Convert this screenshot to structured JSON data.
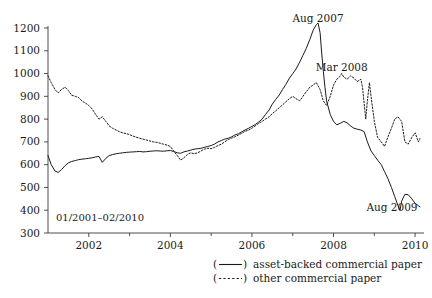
{
  "chart_data": {
    "type": "line",
    "title": "",
    "xlabel": "",
    "ylabel": "",
    "range_note": "01/2001–02/2010",
    "xlim": [
      2001.0,
      2010.12
    ],
    "ylim": [
      300,
      1200
    ],
    "yticks": [
      300,
      400,
      500,
      600,
      700,
      800,
      900,
      1000,
      1100,
      1200
    ],
    "xticks_major": [
      2002,
      2004,
      2006,
      2008,
      2010
    ],
    "xticks_minor": [
      2003,
      2005,
      2007,
      2009
    ],
    "xtick_labels": [
      "2002",
      "2004",
      "2006",
      "2008",
      "2010"
    ],
    "grid": false,
    "legend_position": "below-right",
    "annotations": [
      {
        "text": "Aug 2007",
        "x": 2007.62,
        "y": 1225
      },
      {
        "text": "Mar 2008",
        "x": 2008.2,
        "y": 1010
      },
      {
        "text": "Aug 2009",
        "x": 2009.63,
        "y": 395
      }
    ],
    "series": [
      {
        "name": "asset-backed commercial paper",
        "style": "solid",
        "x": [
          2001.0,
          2001.08,
          2001.17,
          2001.25,
          2001.33,
          2001.42,
          2001.5,
          2001.58,
          2001.67,
          2001.75,
          2001.83,
          2001.92,
          2002.0,
          2002.08,
          2002.17,
          2002.25,
          2002.33,
          2002.42,
          2002.5,
          2002.58,
          2002.67,
          2002.75,
          2002.83,
          2002.92,
          2003.0,
          2003.08,
          2003.17,
          2003.25,
          2003.33,
          2003.42,
          2003.5,
          2003.58,
          2003.67,
          2003.75,
          2003.83,
          2003.92,
          2004.0,
          2004.08,
          2004.17,
          2004.25,
          2004.33,
          2004.42,
          2004.5,
          2004.58,
          2004.67,
          2004.75,
          2004.83,
          2004.92,
          2005.0,
          2005.08,
          2005.17,
          2005.25,
          2005.33,
          2005.42,
          2005.5,
          2005.58,
          2005.67,
          2005.75,
          2005.83,
          2005.92,
          2006.0,
          2006.08,
          2006.17,
          2006.25,
          2006.33,
          2006.42,
          2006.5,
          2006.58,
          2006.67,
          2006.75,
          2006.83,
          2006.92,
          2007.0,
          2007.08,
          2007.17,
          2007.25,
          2007.33,
          2007.42,
          2007.5,
          2007.58,
          2007.62,
          2007.67,
          2007.71,
          2007.75,
          2007.79,
          2007.83,
          2007.92,
          2008.0,
          2008.08,
          2008.17,
          2008.25,
          2008.33,
          2008.42,
          2008.5,
          2008.58,
          2008.67,
          2008.75,
          2008.83,
          2008.92,
          2009.0,
          2009.08,
          2009.17,
          2009.25,
          2009.33,
          2009.42,
          2009.5,
          2009.58,
          2009.63,
          2009.67,
          2009.75,
          2009.83,
          2009.92,
          2010.0,
          2010.08,
          2010.12
        ],
        "y": [
          640,
          600,
          572,
          566,
          578,
          596,
          608,
          614,
          618,
          622,
          624,
          626,
          628,
          630,
          634,
          636,
          610,
          628,
          640,
          644,
          648,
          650,
          652,
          654,
          655,
          656,
          657,
          658,
          656,
          657,
          659,
          660,
          661,
          660,
          659,
          661,
          662,
          658,
          652,
          650,
          656,
          660,
          664,
          668,
          670,
          672,
          676,
          680,
          684,
          690,
          700,
          706,
          712,
          716,
          722,
          730,
          736,
          744,
          752,
          760,
          768,
          776,
          788,
          800,
          820,
          840,
          866,
          886,
          906,
          930,
          952,
          980,
          1000,
          1020,
          1050,
          1080,
          1110,
          1150,
          1190,
          1215,
          1222,
          1180,
          1090,
          1010,
          940,
          880,
          820,
          790,
          775,
          782,
          790,
          784,
          770,
          760,
          756,
          752,
          745,
          700,
          660,
          640,
          620,
          600,
          570,
          540,
          500,
          460,
          420,
          400,
          440,
          470,
          468,
          450,
          430,
          420,
          415
        ]
      },
      {
        "name": "other commercial paper",
        "style": "dotted",
        "x": [
          2001.0,
          2001.08,
          2001.17,
          2001.25,
          2001.33,
          2001.42,
          2001.5,
          2001.58,
          2001.67,
          2001.75,
          2001.83,
          2001.92,
          2002.0,
          2002.08,
          2002.17,
          2002.25,
          2002.33,
          2002.42,
          2002.5,
          2002.58,
          2002.67,
          2002.75,
          2002.83,
          2002.92,
          2003.0,
          2003.08,
          2003.17,
          2003.25,
          2003.33,
          2003.42,
          2003.5,
          2003.58,
          2003.67,
          2003.75,
          2003.83,
          2003.92,
          2004.0,
          2004.08,
          2004.17,
          2004.25,
          2004.33,
          2004.42,
          2004.5,
          2004.58,
          2004.67,
          2004.75,
          2004.83,
          2004.92,
          2005.0,
          2005.08,
          2005.17,
          2005.25,
          2005.33,
          2005.42,
          2005.5,
          2005.58,
          2005.67,
          2005.75,
          2005.83,
          2005.92,
          2006.0,
          2006.08,
          2006.17,
          2006.25,
          2006.33,
          2006.42,
          2006.5,
          2006.58,
          2006.67,
          2006.75,
          2006.83,
          2006.92,
          2007.0,
          2007.08,
          2007.17,
          2007.25,
          2007.33,
          2007.42,
          2007.5,
          2007.58,
          2007.67,
          2007.75,
          2007.83,
          2007.92,
          2008.0,
          2008.08,
          2008.17,
          2008.2,
          2008.25,
          2008.33,
          2008.42,
          2008.5,
          2008.58,
          2008.67,
          2008.71,
          2008.75,
          2008.79,
          2008.83,
          2008.88,
          2008.92,
          2009.0,
          2009.08,
          2009.17,
          2009.25,
          2009.33,
          2009.42,
          2009.5,
          2009.58,
          2009.67,
          2009.75,
          2009.83,
          2009.92,
          2010.0,
          2010.08,
          2010.12
        ],
        "y": [
          990,
          960,
          930,
          915,
          930,
          940,
          925,
          905,
          900,
          895,
          880,
          870,
          860,
          845,
          820,
          800,
          810,
          790,
          770,
          760,
          752,
          745,
          740,
          736,
          732,
          726,
          720,
          716,
          712,
          708,
          704,
          700,
          698,
          694,
          690,
          686,
          680,
          660,
          640,
          620,
          630,
          645,
          652,
          648,
          652,
          660,
          668,
          672,
          670,
          676,
          684,
          690,
          700,
          710,
          716,
          722,
          730,
          738,
          746,
          752,
          760,
          770,
          782,
          790,
          800,
          810,
          824,
          836,
          850,
          862,
          876,
          890,
          900,
          890,
          880,
          900,
          920,
          940,
          950,
          960,
          930,
          880,
          860,
          900,
          950,
          975,
          990,
          1000,
          985,
          975,
          990,
          980,
          965,
          975,
          940,
          870,
          800,
          880,
          960,
          900,
          790,
          720,
          700,
          680,
          720,
          760,
          800,
          810,
          790,
          700,
          690,
          720,
          740,
          700,
          715
        ]
      }
    ]
  },
  "legend": {
    "items": [
      {
        "marker": "(——)",
        "label": "asset-backed commercial paper"
      },
      {
        "marker": "(- - - -)",
        "label": "other commercial paper"
      }
    ]
  }
}
